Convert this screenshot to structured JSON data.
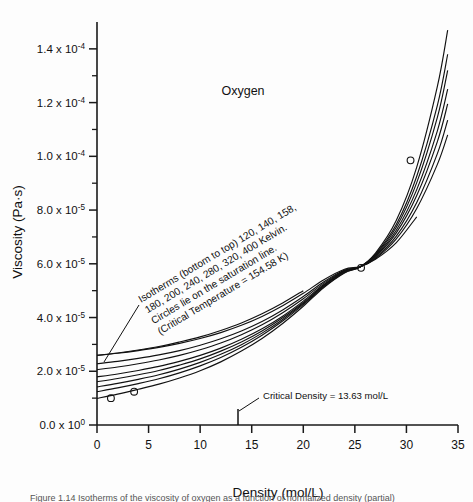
{
  "figure": {
    "title": "Oxygen",
    "caption": "Figure 1.14  Isotherms of the viscosity of oxygen as a function of normalized density (partial)"
  },
  "chart_data": {
    "type": "line",
    "title": "Oxygen",
    "xlabel": "Density (mol/L)",
    "ylabel": "Viscosity (Pa·s)",
    "xlim": [
      0,
      35
    ],
    "ylim": [
      0,
      0.00015
    ],
    "xticks": [
      0,
      5,
      10,
      15,
      20,
      25,
      30,
      35
    ],
    "xtick_labels": [
      "0",
      "5",
      "10",
      "15",
      "20",
      "25",
      "30",
      "35"
    ],
    "yticks": [
      0,
      2e-05,
      4e-05,
      6e-05,
      8e-05,
      0.0001,
      0.00012,
      0.00014
    ],
    "ytick_labels": [
      "0.0 x 10",
      "2.0 x 10",
      "4.0 x 10",
      "6.0 x 10",
      "8.0 x 10",
      "1.0 x 10",
      "1.2 x 10",
      "1.4 x 10"
    ],
    "ytick_exponents": [
      "0",
      "-5",
      "-5",
      "-5",
      "-5",
      "-4",
      "-4",
      "-4"
    ],
    "minor_yticks": [
      1e-05,
      3e-05,
      5e-05,
      7e-05,
      9e-05,
      0.00011,
      0.00013
    ],
    "grid": false,
    "legend": "none",
    "series": [
      {
        "name": "120 K",
        "temperature_K": 120,
        "x": [
          0,
          2,
          4,
          6,
          8,
          10,
          12,
          14,
          16,
          18,
          20,
          22,
          24,
          25.5,
          27,
          29,
          31,
          33,
          34
        ],
        "y": [
          9.9e-06,
          1.15e-05,
          1.33e-05,
          1.52e-05,
          1.75e-05,
          2.02e-05,
          2.35e-05,
          2.75e-05,
          3.22e-05,
          3.78e-05,
          4.42e-05,
          5.12e-05,
          5.66e-05,
          5.88e-05,
          6.4e-05,
          7.6e-05,
          9.6e-05,
          0.000126,
          0.000147
        ]
      },
      {
        "name": "140 K",
        "temperature_K": 140,
        "x": [
          0,
          2,
          4,
          6,
          8,
          10,
          12,
          14,
          16,
          18,
          20,
          22,
          24,
          25.5,
          27,
          29,
          31,
          33,
          34
        ],
        "y": [
          1.24e-05,
          1.38e-05,
          1.54e-05,
          1.72e-05,
          1.94e-05,
          2.2e-05,
          2.51e-05,
          2.89e-05,
          3.34e-05,
          3.87e-05,
          4.48e-05,
          5.15e-05,
          5.68e-05,
          5.88e-05,
          6.36e-05,
          7.45e-05,
          9.26e-05,
          0.000119,
          0.000138
        ]
      },
      {
        "name": "158 K",
        "temperature_K": 158,
        "x": [
          0,
          2,
          4,
          6,
          8,
          10,
          12,
          14,
          16,
          18,
          20,
          22,
          24,
          25.5,
          27,
          29,
          31,
          33,
          34
        ],
        "y": [
          1.42e-05,
          1.55e-05,
          1.7e-05,
          1.87e-05,
          2.08e-05,
          2.33e-05,
          2.63e-05,
          2.99e-05,
          3.42e-05,
          3.93e-05,
          4.52e-05,
          5.18e-05,
          5.7e-05,
          5.88e-05,
          6.33e-05,
          7.35e-05,
          9.02e-05,
          0.0001145,
          0.000132
        ]
      },
      {
        "name": "180 K",
        "temperature_K": 180,
        "x": [
          0,
          2,
          4,
          6,
          8,
          10,
          12,
          14,
          16,
          18,
          20,
          22,
          24,
          25.5,
          27,
          29,
          31,
          33,
          34
        ],
        "y": [
          1.61e-05,
          1.73e-05,
          1.87e-05,
          2.03e-05,
          2.23e-05,
          2.46e-05,
          2.75e-05,
          3.09e-05,
          3.5e-05,
          3.99e-05,
          4.56e-05,
          5.2e-05,
          5.72e-05,
          5.88e-05,
          6.3e-05,
          7.24e-05,
          8.76e-05,
          0.0001095,
          0.000125
        ]
      },
      {
        "name": "200 K",
        "temperature_K": 200,
        "x": [
          0,
          2,
          4,
          6,
          8,
          10,
          12,
          14,
          16,
          18,
          20,
          22,
          24,
          25.5,
          27,
          29,
          31,
          33,
          34
        ],
        "y": [
          1.79e-05,
          1.9e-05,
          2.03e-05,
          2.18e-05,
          2.37e-05,
          2.59e-05,
          2.86e-05,
          3.19e-05,
          3.58e-05,
          4.05e-05,
          4.61e-05,
          5.23e-05,
          5.73e-05,
          5.88e-05,
          6.27e-05,
          7.14e-05,
          8.54e-05,
          0.0001055,
          0.0001195
        ]
      },
      {
        "name": "240 K",
        "temperature_K": 240,
        "x": [
          0,
          2,
          4,
          6,
          8,
          10,
          12,
          14,
          16,
          18,
          20,
          22,
          24,
          25.5,
          27,
          29,
          31,
          33,
          34
        ],
        "y": [
          2.06e-05,
          2.16e-05,
          2.28e-05,
          2.42e-05,
          2.59e-05,
          2.8e-05,
          3.05e-05,
          3.36e-05,
          3.73e-05,
          4.18e-05,
          4.7e-05,
          5.28e-05,
          5.75e-05,
          5.88e-05,
          6.23e-05,
          7.02e-05,
          8.28e-05,
          0.000101,
          0.0001135
        ]
      },
      {
        "name": "280 K",
        "temperature_K": 280,
        "x": [
          0,
          2,
          4,
          6,
          8,
          10,
          12,
          14,
          16,
          18,
          20,
          22,
          24,
          25.5,
          27,
          29,
          31,
          33,
          34
        ],
        "y": [
          2.28e-05,
          2.37e-05,
          2.48e-05,
          2.61e-05,
          2.77e-05,
          2.97e-05,
          3.21e-05,
          3.5e-05,
          3.85e-05,
          4.28e-05,
          4.78e-05,
          5.33e-05,
          5.77e-05,
          5.88e-05,
          6.2e-05,
          6.92e-05,
          8.06e-05,
          9.7e-05,
          0.000108
        ]
      },
      {
        "name": "320 K",
        "temperature_K": 320,
        "x": [
          0,
          2,
          4,
          6,
          8,
          10,
          12,
          14,
          16,
          18,
          20,
          22,
          24,
          25.5,
          27,
          29,
          31
        ],
        "y": [
          2.59e-05,
          2.67e-05,
          2.77e-05,
          2.89e-05,
          3.04e-05,
          3.22e-05,
          3.44e-05,
          3.71e-05,
          4.04e-05,
          4.44e-05,
          4.9e-05,
          5.41e-05,
          5.8e-05,
          5.9e-05,
          6.17e-05,
          6.78e-05,
          7.75e-05
        ]
      },
      {
        "name": "400 K",
        "temperature_K": 400,
        "x": [
          0,
          2,
          4,
          6,
          8,
          10,
          12,
          14,
          16,
          18,
          20
        ],
        "y": [
          2.59e-05,
          2.68e-05,
          2.79e-05,
          2.92e-05,
          3.09e-05,
          3.28e-05,
          3.52e-05,
          3.8e-05,
          4.14e-05,
          4.54e-05,
          5e-05
        ]
      }
    ],
    "saturation_points": [
      {
        "x": 1.35,
        "y": 1e-05
      },
      {
        "x": 3.6,
        "y": 1.24e-05
      },
      {
        "x": 25.6,
        "y": 5.85e-05
      },
      {
        "x": 30.4,
        "y": 9.85e-05
      }
    ],
    "annotations": [
      {
        "name": "isotherm-note",
        "lines": [
          "Isotherms (bottom to top) 120, 140, 158,",
          "180, 200, 240, 280, 320, 400 Kelvin.",
          "Circles lie on the saturation line.",
          "(Critical Temperature = 154.58 K)"
        ],
        "rotation_deg": -31
      },
      {
        "name": "critical-density-note",
        "text": "Critical Density = 13.63 mol/L",
        "value": 13.63,
        "units": "mol/L"
      }
    ]
  },
  "colors": {
    "axis": "#1a1a1a",
    "curve": "#111111",
    "text": "#111111",
    "background": "#fdfdfd"
  }
}
